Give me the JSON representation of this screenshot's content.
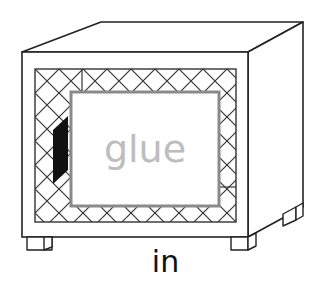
{
  "figure": {
    "type": "preposition-card",
    "object_label": "glue",
    "caption": "in",
    "colors": {
      "outline": "#222222",
      "hatch": "#333333",
      "glue_border": "#8a8a8a",
      "glue_text": "#bdbdbd",
      "shadow": "#111111",
      "background": "#ffffff"
    }
  }
}
